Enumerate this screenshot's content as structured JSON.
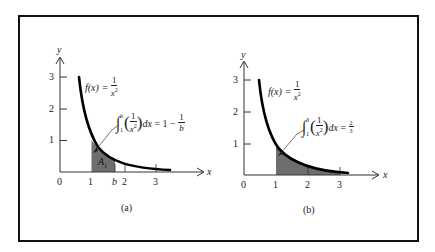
{
  "figure": {
    "panels": [
      {
        "id": "a",
        "caption": "(a)",
        "function_label": {
          "lhs": "f(x) =",
          "num": "1",
          "den": "x",
          "exp": "2"
        },
        "integral": {
          "lower": "1",
          "upper": "b",
          "integrand_num": "1",
          "integrand_den": "x",
          "integrand_exp": "2",
          "dx": "dx",
          "equals": "=",
          "result_lead": "1 −",
          "result_num": "1",
          "result_den": "b"
        },
        "shaded_label": "A",
        "shaded_sub": "1",
        "x_ticks": [
          "0",
          "1",
          "b",
          "2",
          "3"
        ],
        "y_ticks": [
          "1",
          "2",
          "3"
        ],
        "x_axis_label": "x",
        "y_axis_label": "y"
      },
      {
        "id": "b",
        "caption": "(b)",
        "function_label": {
          "lhs": "f(x) =",
          "num": "1",
          "den": "x",
          "exp": "2"
        },
        "integral": {
          "lower": "1",
          "upper": "3",
          "integrand_num": "1",
          "integrand_den": "x",
          "integrand_exp": "2",
          "dx": "dx",
          "equals": "=",
          "result_num": "2",
          "result_den": "3"
        },
        "x_ticks": [
          "0",
          "1",
          "2",
          "3"
        ],
        "y_ticks": [
          "1",
          "2",
          "3"
        ],
        "x_axis_label": "x",
        "y_axis_label": "y"
      }
    ],
    "colors": {
      "frame": "#111111",
      "curve": "#000000",
      "shade": "#6e6e6e",
      "text": "#222222"
    }
  }
}
